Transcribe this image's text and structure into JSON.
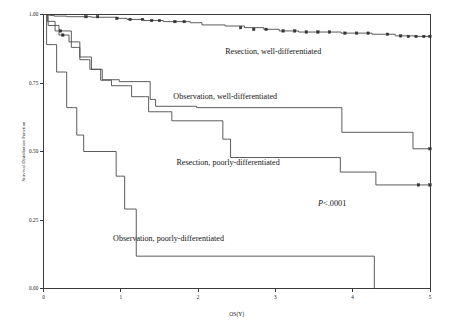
{
  "figure": {
    "background_color": "#ffffff",
    "line_color": "#4a4a4a",
    "text_color": "#141414"
  },
  "chart_data": {
    "type": "line",
    "subtype": "kaplan-meier-step",
    "title": "",
    "subtitle": "",
    "xlabel": "OS(Y)",
    "ylabel": "Survival Distribution Function",
    "xlim": [
      0,
      5
    ],
    "ylim": [
      0,
      1
    ],
    "xticks": [
      0,
      1,
      2,
      3,
      4,
      5
    ],
    "xtick_labels": [
      "0",
      "1",
      "2",
      "3",
      "4",
      "5"
    ],
    "yticks": [
      0,
      0.25,
      0.5,
      0.75,
      1.0
    ],
    "ytick_labels": [
      "0.00",
      "0.25",
      "0.50",
      "0.75",
      "1.00"
    ],
    "grid": false,
    "legend_position": "inline-annotations",
    "annotations": [
      {
        "id": "pvalue",
        "text_italic": "P",
        "text": "<.0001",
        "x": 3.55,
        "y": 0.3
      }
    ],
    "series": [
      {
        "name": "Resection, well-differentiated",
        "label": "Resection, well-differentiated",
        "label_x": 2.35,
        "label_y": 0.855,
        "censored_marker": "filled-square",
        "steps": [
          [
            0.0,
            1.0
          ],
          [
            0.04,
            0.998
          ],
          [
            0.09,
            0.996
          ],
          [
            0.14,
            0.994
          ],
          [
            0.3,
            0.992
          ],
          [
            0.62,
            0.99
          ],
          [
            0.95,
            0.986
          ],
          [
            1.08,
            0.982
          ],
          [
            1.3,
            0.978
          ],
          [
            1.55,
            0.974
          ],
          [
            1.9,
            0.97
          ],
          [
            2.05,
            0.962
          ],
          [
            2.35,
            0.958
          ],
          [
            2.6,
            0.952
          ],
          [
            2.85,
            0.946
          ],
          [
            3.05,
            0.94
          ],
          [
            3.3,
            0.936
          ],
          [
            3.85,
            0.932
          ],
          [
            4.25,
            0.928
          ],
          [
            4.55,
            0.922
          ],
          [
            4.8,
            0.92
          ],
          [
            5.0,
            0.92
          ]
        ],
        "censor_points": [
          [
            0.55,
            0.992
          ],
          [
            0.7,
            0.992
          ],
          [
            0.95,
            0.986
          ],
          [
            1.12,
            0.982
          ],
          [
            1.28,
            0.982
          ],
          [
            1.4,
            0.978
          ],
          [
            1.5,
            0.978
          ],
          [
            1.7,
            0.974
          ],
          [
            1.82,
            0.974
          ],
          [
            2.55,
            0.952
          ],
          [
            2.72,
            0.946
          ],
          [
            2.88,
            0.946
          ],
          [
            3.1,
            0.94
          ],
          [
            3.25,
            0.94
          ],
          [
            3.4,
            0.936
          ],
          [
            3.55,
            0.936
          ],
          [
            3.7,
            0.936
          ],
          [
            3.9,
            0.932
          ],
          [
            4.05,
            0.932
          ],
          [
            4.2,
            0.932
          ],
          [
            4.45,
            0.928
          ],
          [
            4.62,
            0.922
          ],
          [
            4.72,
            0.92
          ],
          [
            4.82,
            0.92
          ],
          [
            4.92,
            0.92
          ],
          [
            5.0,
            0.92
          ]
        ]
      },
      {
        "name": "Observation, well-differentiated",
        "label": "Observation, well-differentiated",
        "label_x": 1.68,
        "label_y": 0.69,
        "censored_marker": "filled-square",
        "steps": [
          [
            0.0,
            1.0
          ],
          [
            0.06,
            0.96
          ],
          [
            0.18,
            0.96
          ],
          [
            0.2,
            0.925
          ],
          [
            0.3,
            0.925
          ],
          [
            0.33,
            0.9
          ],
          [
            0.45,
            0.9
          ],
          [
            0.47,
            0.835
          ],
          [
            0.58,
            0.835
          ],
          [
            0.6,
            0.8
          ],
          [
            0.72,
            0.8
          ],
          [
            0.76,
            0.762
          ],
          [
            0.95,
            0.762
          ],
          [
            0.98,
            0.755
          ],
          [
            1.35,
            0.755
          ],
          [
            1.38,
            0.69
          ],
          [
            1.42,
            0.69
          ],
          [
            1.45,
            0.665
          ],
          [
            1.95,
            0.665
          ],
          [
            1.98,
            0.66
          ],
          [
            3.82,
            0.66
          ],
          [
            3.86,
            0.57
          ],
          [
            4.72,
            0.57
          ],
          [
            4.78,
            0.51
          ],
          [
            5.0,
            0.51
          ]
        ],
        "censor_points": [
          [
            0.25,
            0.925
          ],
          [
            5.0,
            0.51
          ]
        ]
      },
      {
        "name": "Resection, poorly-differentiated",
        "label": "Resection, poorly-differentiated",
        "label_x": 1.72,
        "label_y": 0.452,
        "censored_marker": "filled-square",
        "steps": [
          [
            0.0,
            1.0
          ],
          [
            0.05,
            0.975
          ],
          [
            0.12,
            0.975
          ],
          [
            0.15,
            0.94
          ],
          [
            0.33,
            0.94
          ],
          [
            0.36,
            0.88
          ],
          [
            0.44,
            0.88
          ],
          [
            0.47,
            0.845
          ],
          [
            0.58,
            0.845
          ],
          [
            0.62,
            0.8
          ],
          [
            0.7,
            0.8
          ],
          [
            0.74,
            0.76
          ],
          [
            0.85,
            0.76
          ],
          [
            0.88,
            0.74
          ],
          [
            1.1,
            0.74
          ],
          [
            1.14,
            0.7
          ],
          [
            1.32,
            0.7
          ],
          [
            1.36,
            0.645
          ],
          [
            1.62,
            0.645
          ],
          [
            1.66,
            0.612
          ],
          [
            2.28,
            0.612
          ],
          [
            2.32,
            0.545
          ],
          [
            2.38,
            0.545
          ],
          [
            2.42,
            0.478
          ],
          [
            3.8,
            0.478
          ],
          [
            3.84,
            0.425
          ],
          [
            4.25,
            0.425
          ],
          [
            4.3,
            0.378
          ],
          [
            5.0,
            0.378
          ]
        ],
        "censor_points": [
          [
            0.22,
            0.94
          ],
          [
            4.85,
            0.378
          ],
          [
            5.0,
            0.378
          ]
        ]
      },
      {
        "name": "Observation, poorly-differentiated",
        "label": "Observation, poorly-differentiated",
        "label_x": 0.9,
        "label_y": 0.175,
        "censored_marker": "none",
        "steps": [
          [
            0.0,
            1.0
          ],
          [
            0.04,
            0.89
          ],
          [
            0.13,
            0.89
          ],
          [
            0.17,
            0.79
          ],
          [
            0.27,
            0.79
          ],
          [
            0.3,
            0.66
          ],
          [
            0.39,
            0.66
          ],
          [
            0.43,
            0.56
          ],
          [
            0.48,
            0.56
          ],
          [
            0.52,
            0.5
          ],
          [
            0.9,
            0.5
          ],
          [
            0.94,
            0.41
          ],
          [
            1.0,
            0.41
          ],
          [
            1.05,
            0.29
          ],
          [
            1.16,
            0.29
          ],
          [
            1.2,
            0.118
          ],
          [
            4.28,
            0.118
          ],
          [
            4.28,
            0.0
          ]
        ],
        "censor_points": []
      }
    ]
  }
}
